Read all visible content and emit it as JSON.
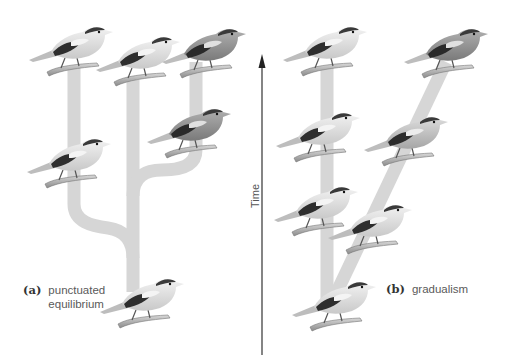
{
  "figure": {
    "panels": [
      {
        "id": "a",
        "tag": "(a)",
        "title_line1": "punctuated",
        "title_line2": "equilibrium",
        "model": "punctuated equilibrium",
        "bird_count": 6
      },
      {
        "id": "b",
        "tag": "(b)",
        "title": "gradualism",
        "model": "gradualism",
        "bird_count": 7
      }
    ],
    "axis": {
      "label": "Time",
      "direction": "up"
    },
    "colors": {
      "branch": "#d6d6d6",
      "arrow": "#333333",
      "bird_light": "#e6e6e6",
      "bird_dark": "#2e2e2e",
      "bird_mid": "#8a8a8a",
      "label_text": "#5a5a5a"
    }
  }
}
